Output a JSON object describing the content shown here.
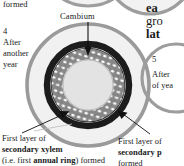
{
  "diagram": {
    "title_fragment_top_left": "formed",
    "cambium_label": "Cambium",
    "step4": {
      "number": "4",
      "line1": "After",
      "line2": "another",
      "line3": "year"
    },
    "step5": {
      "number": "5",
      "line1": "After",
      "line2": "of yea"
    },
    "right_heading": {
      "line1": "ea",
      "line2": "gro",
      "line3": "lat"
    },
    "caption_bottom_left": {
      "line1": "First layer of",
      "line2": "secondary xylem",
      "line3_pre": "(i.e. first ",
      "line3_bold": "annual ring",
      "line3_post": ") formed"
    },
    "caption_bottom_right": {
      "line1": "First layer of",
      "line2": "secondary p",
      "line3": "formed"
    },
    "colors": {
      "outer_ring": "#9a9a9a",
      "outer_fill": "#f0f0f0",
      "cambium_ring": "#1c1c1c",
      "xylem_band": "#8c8c8c",
      "cells": "#ffffff",
      "pith": "#e2e2e2",
      "arrow": "#111111",
      "text": "#1a1a1a"
    },
    "rings": [
      {
        "name": "epidermis-cortex-outer",
        "r": 62,
        "stroke": 3.5
      },
      {
        "name": "secondary-phloem-ring",
        "r": 41,
        "stroke": 7
      },
      {
        "name": "cambium-ring",
        "r": 36,
        "stroke": 5
      },
      {
        "name": "secondary-xylem-band",
        "r": 30,
        "stroke": 11
      },
      {
        "name": "pith",
        "r": 22,
        "stroke": 0
      }
    ],
    "arrows": [
      {
        "name": "cambium-arrow",
        "from": [
          88,
          24
        ],
        "to": [
          88,
          54
        ]
      },
      {
        "name": "xylem-arrow",
        "from": [
          27,
          137
        ],
        "to": [
          67,
          112
        ]
      },
      {
        "name": "phloem-arrow",
        "from": [
          146,
          136
        ],
        "to": [
          119,
          113
        ]
      }
    ]
  }
}
